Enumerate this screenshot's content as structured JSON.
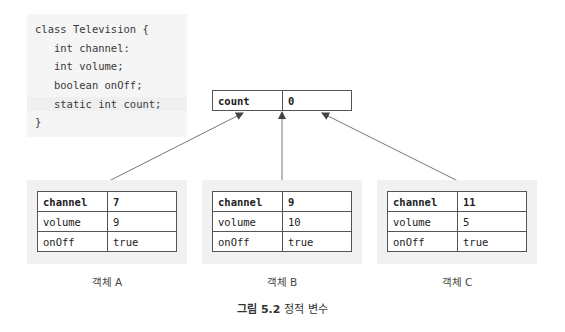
{
  "code": {
    "lines": [
      "class Television {",
      "   int channel:",
      "   int volume;",
      "   boolean onOff;",
      "   static int count;",
      "}"
    ]
  },
  "static_field": {
    "name": "count",
    "value": "0"
  },
  "objects": [
    {
      "label": "객체 A",
      "fields": [
        {
          "name": "channel",
          "value": "7"
        },
        {
          "name": "volume",
          "value": "9"
        },
        {
          "name": "onOff",
          "value": "true"
        }
      ]
    },
    {
      "label": "객체 B",
      "fields": [
        {
          "name": "channel",
          "value": "9"
        },
        {
          "name": "volume",
          "value": "10"
        },
        {
          "name": "onOff",
          "value": "true"
        }
      ]
    },
    {
      "label": "객체 C",
      "fields": [
        {
          "name": "channel",
          "value": "11"
        },
        {
          "name": "volume",
          "value": "5"
        },
        {
          "name": "onOff",
          "value": "true"
        }
      ]
    }
  ],
  "caption": {
    "number": "그림 5.2",
    "title": "정적 변수"
  },
  "colors": {
    "panel_bg": "#f1f1f1",
    "code_bg": "#f5f5f5",
    "border": "#555555",
    "arrow": "#555555"
  }
}
